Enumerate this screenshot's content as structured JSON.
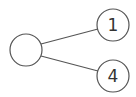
{
  "diagram": {
    "type": "tree",
    "nodes": [
      {
        "id": "root",
        "label": "",
        "cx": 26,
        "cy": 50,
        "r": 16
      },
      {
        "id": "n1",
        "label": "1",
        "cx": 113,
        "cy": 25,
        "r": 16
      },
      {
        "id": "n4",
        "label": "4",
        "cx": 113,
        "cy": 76,
        "r": 16
      }
    ],
    "edges": [
      {
        "from": "root",
        "to": "n1"
      },
      {
        "from": "root",
        "to": "n4"
      }
    ],
    "colors": {
      "stroke": "#555555",
      "text": "#333333",
      "background": "#ffffff"
    }
  }
}
